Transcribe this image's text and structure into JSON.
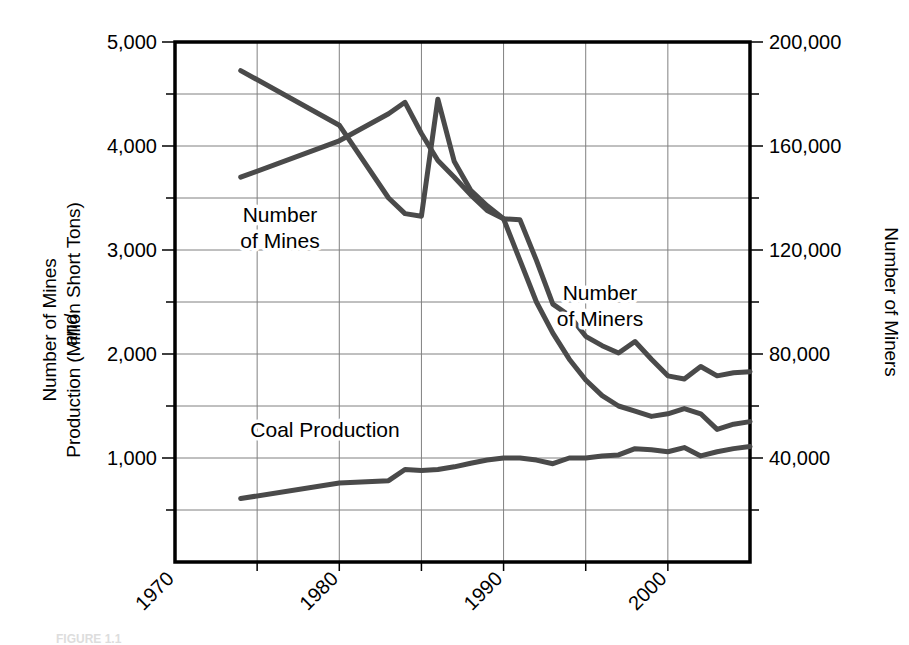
{
  "figure": {
    "caption": "FIGURE 1.1"
  },
  "chart_data": {
    "type": "line",
    "title": "",
    "xlabel": "",
    "ylabel": "Number of Mines and Production (Million Short Tons)",
    "y2label": "Number of Miners",
    "grid": true,
    "legend": "inline-annotations",
    "xlim": [
      1970,
      2005
    ],
    "xticks": [
      1970,
      1980,
      1990,
      2000
    ],
    "xtick_labels": [
      "1970",
      "1980",
      "1990",
      "2000"
    ],
    "xminor_step": 5,
    "ylim": [
      0,
      5000
    ],
    "yticks": [
      1000,
      2000,
      3000,
      4000,
      5000
    ],
    "ytick_labels": [
      "1,000",
      "2,000",
      "3,000",
      "4,000",
      "5,000"
    ],
    "yminor_step": 500,
    "y2lim": [
      0,
      200000
    ],
    "y2ticks": [
      40000,
      80000,
      120000,
      160000,
      200000
    ],
    "y2tick_labels": [
      "40,000",
      "80,000",
      "120,000",
      "160,000",
      "200,000"
    ],
    "series": [
      {
        "name": "Number of Mines",
        "axis": "left",
        "color": "#4a4a4a",
        "annotation": "Number of Mines",
        "x": [
          1974,
          1980,
          1983,
          1984,
          1985,
          1986,
          1987,
          1988,
          1989,
          1990,
          1991,
          1992,
          1993,
          1994,
          1995,
          1996,
          1997,
          1998,
          1999,
          2000,
          2001,
          2002,
          2003,
          2004,
          2005
        ],
        "values": [
          3700,
          4050,
          4310,
          4420,
          4120,
          3860,
          3700,
          3530,
          3380,
          3300,
          3290,
          2900,
          2480,
          2370,
          2170,
          2080,
          2010,
          2120,
          1950,
          1790,
          1760,
          1880,
          1790,
          1820,
          1830
        ]
      },
      {
        "name": "Number of Miners",
        "axis": "right",
        "color": "#4a4a4a",
        "annotation": "Number of Miners",
        "x": [
          1974,
          1980,
          1983,
          1984,
          1985,
          1986,
          1987,
          1988,
          1989,
          1990,
          1991,
          1992,
          1993,
          1994,
          1995,
          1996,
          1997,
          1998,
          1999,
          2000,
          2001,
          2002,
          2003,
          2004,
          2005
        ],
        "values": [
          189000,
          168000,
          140000,
          134000,
          133000,
          178000,
          154000,
          143000,
          137000,
          132000,
          116000,
          100000,
          88000,
          78000,
          70000,
          64000,
          60000,
          58000,
          56000,
          57000,
          59000,
          57000,
          51000,
          53000,
          54000
        ]
      },
      {
        "name": "Coal Production",
        "axis": "left",
        "color": "#4a4a4a",
        "annotation": "Coal Production",
        "x": [
          1974,
          1980,
          1983,
          1984,
          1985,
          1986,
          1987,
          1988,
          1989,
          1990,
          1991,
          1992,
          1993,
          1994,
          1995,
          1996,
          1997,
          1998,
          1999,
          2000,
          2001,
          2002,
          2003,
          2004,
          2005
        ],
        "values": [
          610,
          760,
          782,
          890,
          880,
          890,
          915,
          950,
          980,
          1000,
          1000,
          980,
          945,
          1000,
          1000,
          1020,
          1030,
          1090,
          1080,
          1060,
          1100,
          1020,
          1060,
          1090,
          1110
        ]
      }
    ],
    "annotations": [
      {
        "text": "Number\nof Mines",
        "lines": [
          "Number",
          "of Mines"
        ],
        "x_px": 280,
        "y_px": 222
      },
      {
        "text": "Number\nof Miners",
        "lines": [
          "Number",
          "of Miners"
        ],
        "x_px": 600,
        "y_px": 300
      },
      {
        "text": "Coal Production",
        "lines": [
          "Coal Production"
        ],
        "x_px": 325,
        "y_px": 437
      }
    ]
  },
  "left_axis": {
    "line1": "Number of Mines",
    "line2": "and",
    "line3": "Production (Million Short Tons)"
  },
  "right_axis": {
    "title": "Number of Miners"
  },
  "colors": {
    "series": "#4a4a4a",
    "grid": "#808080",
    "frame": "#000000",
    "background": "#ffffff"
  }
}
